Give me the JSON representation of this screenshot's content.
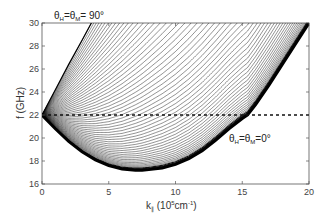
{
  "chart_data": {
    "type": "line",
    "title": "",
    "xlabel": "k∥ (10⁵cm⁻¹)",
    "xlabel_parts": {
      "base": "k",
      "sub": "∥",
      "unit_pre": " (10",
      "sup1": "5",
      "unit_mid": "cm",
      "sup2": "-1",
      "unit_post": ")"
    },
    "ylabel": "f (GHz)",
    "xlim": [
      0,
      20
    ],
    "ylim": [
      16,
      30
    ],
    "xticks": [
      0,
      5,
      10,
      15,
      20
    ],
    "yticks": [
      16,
      18,
      20,
      22,
      24,
      26,
      28,
      30
    ],
    "grid": false,
    "legend": null,
    "series": [
      {
        "name": "θH=θM=90° (upper boundary)",
        "x": [
          0,
          1,
          2,
          3,
          3.7
        ],
        "y": [
          22,
          24.2,
          26.4,
          28.5,
          30
        ]
      },
      {
        "name": "θH=θM=0° (lower envelope)",
        "x": [
          0,
          1,
          2,
          3,
          4,
          5,
          6,
          7,
          7.5,
          8,
          9,
          10,
          11,
          12,
          13,
          14,
          15,
          15.4,
          16,
          17,
          18,
          19,
          20
        ],
        "y": [
          22,
          20.8,
          19.7,
          18.8,
          18.1,
          17.6,
          17.3,
          17.2,
          17.2,
          17.25,
          17.4,
          17.7,
          18.2,
          18.9,
          19.8,
          20.8,
          21.7,
          22,
          22.9,
          24.6,
          26.4,
          28.2,
          30
        ]
      },
      {
        "name": "reference line f = 22 GHz (dashed)",
        "x": [
          0,
          20
        ],
        "y": [
          22,
          22
        ],
        "style": "dashed"
      }
    ],
    "curve_count_approx": 60,
    "annotations": [
      {
        "text": "θH=θM= 90°",
        "position": "top-left above axes",
        "x": 1.5,
        "y": 30.4
      },
      {
        "text": "θH=θM=0°",
        "position": "right, below dashed line",
        "x": 15.2,
        "y": 20.5
      }
    ]
  },
  "labels": {
    "annot_top": {
      "t1": "θ",
      "s1": "H",
      "mid": "=θ",
      "s2": "M",
      "end": "= 90°"
    },
    "annot_right": {
      "t1": "θ",
      "s1": "H",
      "mid": "=θ",
      "s2": "M",
      "end": "=0°"
    },
    "ylabel": "f (GHz)",
    "xlabel": {
      "base": "k",
      "sub": "∥",
      "pre": " (10",
      "sup1": "5",
      "mid": "cm",
      "sup2": "-1",
      "post": ")"
    },
    "xticks": [
      "0",
      "5",
      "10",
      "15",
      "20"
    ],
    "yticks": [
      "16",
      "18",
      "20",
      "22",
      "24",
      "26",
      "28",
      "30"
    ]
  }
}
